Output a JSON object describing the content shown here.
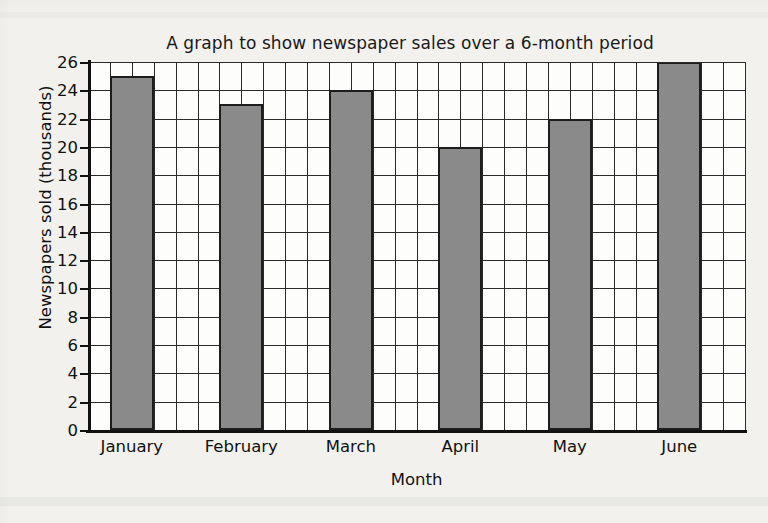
{
  "chart_data": {
    "type": "bar",
    "title": "A graph to show newspaper sales over a 6-month period",
    "xlabel": "Month",
    "ylabel": "Newspapers sold (thousands)",
    "categories": [
      "January",
      "February",
      "March",
      "April",
      "May",
      "June"
    ],
    "values": [
      25,
      23,
      24,
      20,
      22,
      26
    ],
    "ylim": [
      0,
      26
    ],
    "ytick_step": 2,
    "yticks": [
      0,
      2,
      4,
      6,
      8,
      10,
      12,
      14,
      16,
      18,
      20,
      22,
      24,
      26
    ],
    "grid": "both",
    "legend": "none",
    "bar_color": "#8a8a8a",
    "bar_edge_color": "#1d1d1d",
    "grid_color": "#2a2a2a",
    "axis_color": "#111111",
    "plot_background": "#fdfdfc",
    "page_background": "#f2f1ee",
    "series": [
      {
        "name": "Newspapers sold (thousands)",
        "values": [
          25,
          23,
          24,
          20,
          22,
          26
        ]
      }
    ],
    "grid_columns_per_category": 5,
    "bar_width_in_columns": 2,
    "bar_offset_in_columns": 1
  }
}
